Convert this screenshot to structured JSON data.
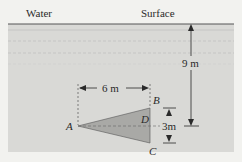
{
  "labels": {
    "water": "Water",
    "surface": "Surface",
    "depth": "9 m",
    "width": "6 m",
    "height": "3m",
    "point_a": "A",
    "point_b": "B",
    "point_c": "C",
    "point_d": "D"
  },
  "colors": {
    "background": "#f2f2ef",
    "water": "#d9d9d6",
    "triangle": "#a9a9a6",
    "line": "#2a2a2a"
  }
}
